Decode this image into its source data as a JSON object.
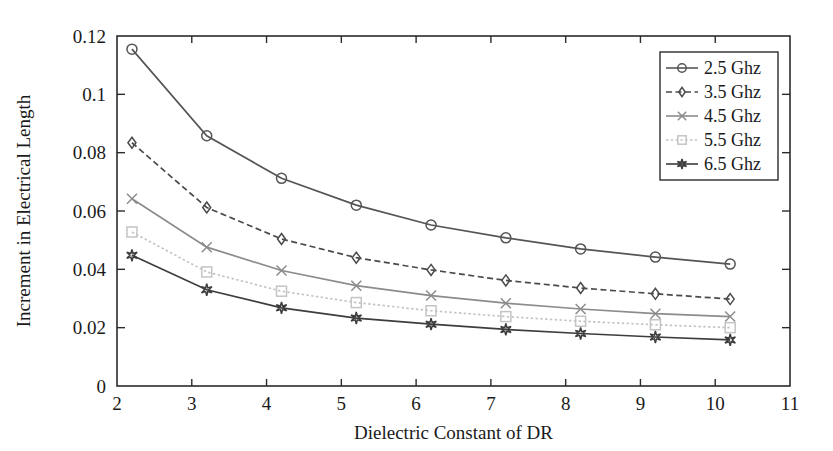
{
  "chart_data": {
    "type": "line",
    "title": "",
    "xlabel": "Dielectric Constant of DR",
    "ylabel": "Increment in Electrical Length",
    "xlim": [
      2,
      11
    ],
    "ylim": [
      0,
      0.12
    ],
    "grid": false,
    "legend_position": "upper right",
    "xticks": [
      "2",
      "3",
      "4",
      "5",
      "6",
      "7",
      "8",
      "9",
      "10",
      "11"
    ],
    "xtick_values": [
      2,
      3,
      4,
      5,
      6,
      7,
      8,
      9,
      10,
      11
    ],
    "yticks": [
      "0",
      "0.02",
      "0.04",
      "0.06",
      "0.08",
      "0.1",
      "0.12"
    ],
    "ytick_values": [
      0,
      0.02,
      0.04,
      0.06,
      0.08,
      0.1,
      0.12
    ],
    "x": [
      2.2,
      3.2,
      4.2,
      5.2,
      6.2,
      7.2,
      8.2,
      9.2,
      10.2
    ],
    "series": [
      {
        "name": "2.5 Ghz",
        "marker": "circle",
        "linestyle": "solid",
        "color": "#555555",
        "values": [
          0.1155,
          0.0858,
          0.0712,
          0.062,
          0.0552,
          0.0508,
          0.047,
          0.0442,
          0.0418
        ]
      },
      {
        "name": "3.5 Ghz",
        "marker": "diamond",
        "linestyle": "dashed",
        "color": "#4a4a4a",
        "values": [
          0.0834,
          0.0612,
          0.0504,
          0.044,
          0.0398,
          0.0362,
          0.0336,
          0.0316,
          0.0298
        ]
      },
      {
        "name": "4.5 Ghz",
        "marker": "x",
        "linestyle": "solid",
        "color": "#8c8c8c",
        "values": [
          0.0642,
          0.0476,
          0.0396,
          0.0344,
          0.031,
          0.0284,
          0.0264,
          0.0248,
          0.0238
        ]
      },
      {
        "name": "5.5 Ghz",
        "marker": "square",
        "linestyle": "dotted",
        "color": "#c4c4c4",
        "values": [
          0.0528,
          0.0391,
          0.0325,
          0.0286,
          0.0258,
          0.0238,
          0.0222,
          0.021,
          0.02
        ]
      },
      {
        "name": "6.5 Ghz",
        "marker": "star",
        "linestyle": "solid",
        "color": "#3d3d3d",
        "values": [
          0.0448,
          0.033,
          0.0268,
          0.0233,
          0.0212,
          0.0194,
          0.018,
          0.0168,
          0.0158
        ]
      }
    ]
  },
  "axes": {
    "frame_color": "#2b2b2b",
    "background": "#ffffff"
  }
}
